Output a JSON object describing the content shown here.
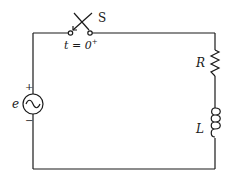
{
  "diagram": {
    "type": "RL circuit with AC source and switch",
    "switch": {
      "label": "S",
      "time_label": "t = 0",
      "time_superscript": "+"
    },
    "source": {
      "label": "e",
      "positive": "+",
      "negative": "−",
      "symbol": "~"
    },
    "resistor": {
      "label": "R"
    },
    "inductor": {
      "label": "L"
    },
    "colors": {
      "line": "#1a1a1a",
      "background": "#ffffff"
    }
  }
}
